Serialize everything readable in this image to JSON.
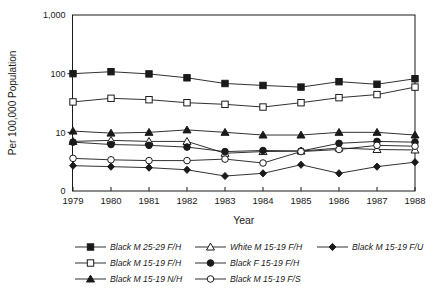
{
  "figure": {
    "background": "#ffffff",
    "line_color": "#1a1a1a",
    "text_color": "#1a1a1a"
  },
  "chart_data": {
    "type": "line",
    "title": "",
    "xlabel": "Year",
    "ylabel": "Per 100,000 Population",
    "y_scale": "log",
    "ylim": [
      1,
      1000
    ],
    "y_ticks": [
      "1,000",
      "100",
      "10",
      "0"
    ],
    "x": [
      1979,
      1980,
      1981,
      1982,
      1983,
      1984,
      1985,
      1986,
      1987,
      1988
    ],
    "series": [
      {
        "name": "Black M 25-29 F/H",
        "marker": "square-filled",
        "values": [
          100,
          108,
          99,
          85,
          68,
          63,
          59,
          73,
          66,
          82
        ]
      },
      {
        "name": "Black M 15-19 F/H",
        "marker": "square-open",
        "values": [
          33,
          38,
          36,
          32,
          30,
          27,
          32,
          39,
          44,
          59
        ]
      },
      {
        "name": "Black M 15-19 N/H",
        "marker": "triangle-filled",
        "values": [
          10.5,
          9.7,
          10.0,
          11.0,
          10.0,
          9.0,
          9.0,
          10.0,
          10.0,
          9.0
        ]
      },
      {
        "name": "White M 15-19 F/H",
        "marker": "triangle-open",
        "values": [
          7.0,
          7.3,
          7.0,
          7.0,
          4.4,
          4.7,
          4.8,
          5.4,
          5.1,
          5.0
        ]
      },
      {
        "name": "Black F 15-19 F/H",
        "marker": "circle-filled",
        "values": [
          6.8,
          6.2,
          6.0,
          5.6,
          4.7,
          4.9,
          4.8,
          6.5,
          7.0,
          6.8
        ]
      },
      {
        "name": "Black M 15-19 F/S",
        "marker": "circle-open",
        "values": [
          3.6,
          3.4,
          3.3,
          3.3,
          3.5,
          3.0,
          4.7,
          5.1,
          6.0,
          5.8
        ]
      },
      {
        "name": "Black M 15-19 F/U",
        "marker": "diamond-filled",
        "values": [
          2.7,
          2.6,
          2.5,
          2.3,
          1.8,
          2.0,
          2.8,
          2.0,
          2.6,
          3.1
        ]
      }
    ],
    "legend": {
      "position": "bottom",
      "columns_idx": [
        [
          0,
          1,
          2
        ],
        [
          3,
          4,
          5
        ],
        [
          6
        ]
      ]
    }
  }
}
